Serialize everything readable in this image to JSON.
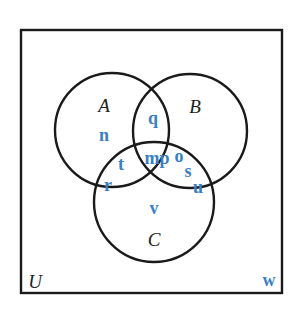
{
  "diagram": {
    "type": "venn-3",
    "colors": {
      "outline": "#1a1a1a",
      "set_label": "#222222",
      "element": "#3a7fc4",
      "background": "#ffffff"
    },
    "universe": {
      "label": "U",
      "rect": {
        "x": 21,
        "y": 30,
        "w": 261,
        "h": 263
      }
    },
    "sets": [
      {
        "id": "A",
        "label": "A",
        "cx": 112,
        "cy": 130,
        "r": 57
      },
      {
        "id": "B",
        "label": "B",
        "cx": 190,
        "cy": 131,
        "r": 57
      },
      {
        "id": "C",
        "label": "C",
        "cx": 154,
        "cy": 202,
        "r": 60
      }
    ],
    "regions": {
      "A_only": [
        "n"
      ],
      "B_only": [],
      "C_only": [
        "v"
      ],
      "A_and_B_only": [
        "q"
      ],
      "A_and_C_only": [
        "t",
        "r"
      ],
      "B_and_C_only": [
        "o",
        "s",
        "u"
      ],
      "A_and_B_and_C": [
        "m",
        "p"
      ],
      "outside": [
        "w"
      ]
    },
    "elements": [
      {
        "text": "q",
        "x": 153,
        "y": 124
      },
      {
        "text": "n",
        "x": 104,
        "y": 141
      },
      {
        "text": "mp",
        "x": 157,
        "y": 164
      },
      {
        "text": "o",
        "x": 179,
        "y": 162
      },
      {
        "text": "s",
        "x": 188,
        "y": 177
      },
      {
        "text": "u",
        "x": 198,
        "y": 193
      },
      {
        "text": "t",
        "x": 121,
        "y": 170
      },
      {
        "text": "r",
        "x": 108,
        "y": 191
      },
      {
        "text": "v",
        "x": 154,
        "y": 214
      },
      {
        "text": "w",
        "x": 269,
        "y": 286
      }
    ],
    "label_positions": {
      "A": {
        "x": 104,
        "y": 112
      },
      "B": {
        "x": 195,
        "y": 113
      },
      "C": {
        "x": 154,
        "y": 246
      },
      "U": {
        "x": 35,
        "y": 288
      }
    }
  }
}
